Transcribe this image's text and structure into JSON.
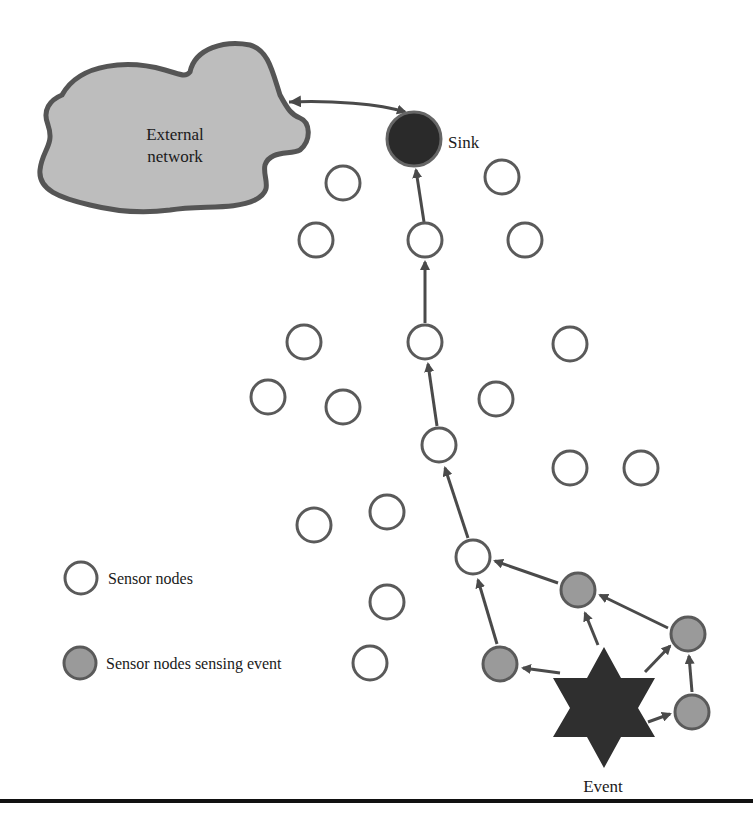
{
  "diagram": {
    "cloud": {
      "label_line1": "External",
      "label_line2": "network",
      "fill": "#bdbdbd",
      "stroke": "#555555"
    },
    "sink": {
      "label": "Sink",
      "fill": "#2a2a2a",
      "stroke": "#666666"
    },
    "event": {
      "label": "Event",
      "fill": "#2f2f2f"
    },
    "legend": [
      {
        "label": "Sensor nodes",
        "type": "sensor-node"
      },
      {
        "label": "Sensor nodes sensing event",
        "type": "sensing-node"
      }
    ],
    "colors": {
      "node_stroke": "#5a5a5a",
      "node_fill": "#ffffff",
      "sensing_fill": "#9a9a9a",
      "arrow": "#4a4a4a"
    },
    "sensor_nodes": [
      {
        "x": 343,
        "y": 183
      },
      {
        "x": 502,
        "y": 177
      },
      {
        "x": 316,
        "y": 240
      },
      {
        "x": 425,
        "y": 240
      },
      {
        "x": 525,
        "y": 240
      },
      {
        "x": 304,
        "y": 342
      },
      {
        "x": 425,
        "y": 342
      },
      {
        "x": 570,
        "y": 344
      },
      {
        "x": 268,
        "y": 397
      },
      {
        "x": 343,
        "y": 407
      },
      {
        "x": 496,
        "y": 399
      },
      {
        "x": 439,
        "y": 445
      },
      {
        "x": 570,
        "y": 468
      },
      {
        "x": 641,
        "y": 468
      },
      {
        "x": 314,
        "y": 525
      },
      {
        "x": 387,
        "y": 512
      },
      {
        "x": 473,
        "y": 557
      },
      {
        "x": 387,
        "y": 602
      },
      {
        "x": 370,
        "y": 663
      }
    ],
    "sensing_nodes": [
      {
        "x": 578,
        "y": 590
      },
      {
        "x": 688,
        "y": 634
      },
      {
        "x": 500,
        "y": 664
      },
      {
        "x": 692,
        "y": 712
      }
    ]
  }
}
